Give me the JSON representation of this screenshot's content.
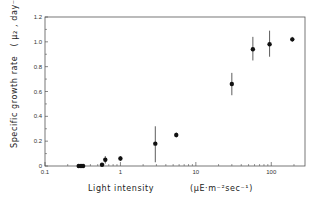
{
  "chart_data": {
    "type": "scatter",
    "title": "",
    "xlabel": "Light intensity",
    "xlabel_units": "(μE·m⁻²sec⁻¹)",
    "ylabel": "Specific growth rate",
    "ylabel_units": "( μ₂ , day⁻¹ )",
    "xscale": "log",
    "xlim": [
      0.1,
      280
    ],
    "ylim": [
      0,
      1.2
    ],
    "grid": false,
    "legend": null,
    "x_ticks": [
      {
        "value": 0.1,
        "label": "0.1"
      },
      {
        "value": 1,
        "label": "1"
      },
      {
        "value": 10,
        "label": "10"
      },
      {
        "value": 100,
        "label": "100"
      }
    ],
    "y_ticks": [
      {
        "value": 0,
        "label": "0"
      },
      {
        "value": 0.2,
        "label": "0.2"
      },
      {
        "value": 0.4,
        "label": "0.4"
      },
      {
        "value": 0.6,
        "label": "0.6"
      },
      {
        "value": 0.8,
        "label": "0.8"
      },
      {
        "value": 1.0,
        "label": "1.0"
      },
      {
        "value": 1.2,
        "label": "1.2"
      }
    ],
    "series": [
      {
        "name": "growth rate",
        "points": [
          {
            "x": 0.28,
            "y": 0.0,
            "err_low": 0.0,
            "err_high": 0.0
          },
          {
            "x": 0.3,
            "y": 0.0,
            "err_low": 0.0,
            "err_high": 0.0
          },
          {
            "x": 0.32,
            "y": 0.0,
            "err_low": 0.0,
            "err_high": 0.0
          },
          {
            "x": 0.57,
            "y": 0.01,
            "err_low": 0.01,
            "err_high": 0.01
          },
          {
            "x": 0.63,
            "y": 0.05,
            "err_low": 0.03,
            "err_high": 0.03
          },
          {
            "x": 1.0,
            "y": 0.06,
            "err_low": 0.02,
            "err_high": 0.02
          },
          {
            "x": 2.9,
            "y": 0.18,
            "err_low": 0.15,
            "err_high": 0.14
          },
          {
            "x": 5.5,
            "y": 0.25,
            "err_low": 0.02,
            "err_high": 0.02
          },
          {
            "x": 30,
            "y": 0.66,
            "err_low": 0.09,
            "err_high": 0.09
          },
          {
            "x": 57,
            "y": 0.94,
            "err_low": 0.09,
            "err_high": 0.1
          },
          {
            "x": 95,
            "y": 0.98,
            "err_low": 0.1,
            "err_high": 0.11
          },
          {
            "x": 190,
            "y": 1.02,
            "err_low": 0.02,
            "err_high": 0.02
          }
        ]
      }
    ]
  }
}
